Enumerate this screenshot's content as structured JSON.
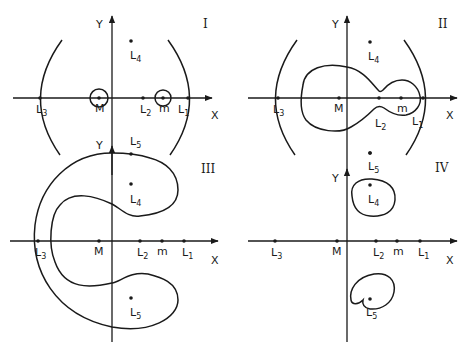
{
  "figure": {
    "panels": [
      {
        "id": "I",
        "roman_label": "I",
        "axis_x_label": "X",
        "axis_y_label": "Y",
        "points": [
          {
            "name": "L",
            "sub": "3"
          },
          {
            "name": "M",
            "sub": ""
          },
          {
            "name": "L",
            "sub": "2"
          },
          {
            "name": "m",
            "sub": ""
          },
          {
            "name": "L",
            "sub": "1"
          },
          {
            "name": "L",
            "sub": "4"
          }
        ],
        "curves": [
          "small circle around M",
          "small circle around m",
          "large outer arcs left and right"
        ]
      },
      {
        "id": "II",
        "roman_label": "II",
        "axis_x_label": "X",
        "axis_y_label": "Y",
        "points": [
          {
            "name": "L",
            "sub": "3"
          },
          {
            "name": "M",
            "sub": ""
          },
          {
            "name": "L",
            "sub": "2"
          },
          {
            "name": "m",
            "sub": ""
          },
          {
            "name": "L",
            "sub": "1"
          },
          {
            "name": "L",
            "sub": "4"
          },
          {
            "name": "L",
            "sub": "5"
          }
        ],
        "curves": [
          "dumbbell contour enclosing M and m joined at L2",
          "large outer arcs left and right"
        ]
      },
      {
        "id": "III",
        "roman_label": "III",
        "axis_x_label": "X",
        "axis_y_label": "Y",
        "points": [
          {
            "name": "L",
            "sub": "3"
          },
          {
            "name": "M",
            "sub": ""
          },
          {
            "name": "L",
            "sub": "2"
          },
          {
            "name": "m",
            "sub": ""
          },
          {
            "name": "L",
            "sub": "1"
          },
          {
            "name": "L",
            "sub": "4"
          },
          {
            "name": "L",
            "sub": "5"
          }
        ],
        "curves": [
          "horseshoe-shaped forbidden region around L3, L4, L5"
        ]
      },
      {
        "id": "IV",
        "roman_label": "IV",
        "axis_x_label": "X",
        "axis_y_label": "Y",
        "points": [
          {
            "name": "L",
            "sub": "3"
          },
          {
            "name": "M",
            "sub": ""
          },
          {
            "name": "L",
            "sub": "2"
          },
          {
            "name": "m",
            "sub": ""
          },
          {
            "name": "L",
            "sub": "1"
          },
          {
            "name": "L",
            "sub": "4"
          },
          {
            "name": "L",
            "sub": "5"
          }
        ],
        "curves": [
          "small closed loop around L4",
          "small closed loop around L5"
        ]
      }
    ]
  }
}
